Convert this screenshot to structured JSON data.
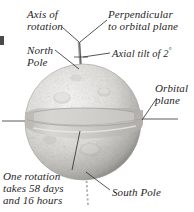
{
  "figure": {
    "background_color": "#ffffff",
    "ink_color": "#262626"
  },
  "labels": {
    "axis_of_rotation": "Axis of\nrotation",
    "perpendicular": "Perpendicular\nto orbital plane",
    "north_pole": "North\nPole",
    "axial_tilt_prefix": "Axial tilt of 2",
    "axial_tilt_degree": "°",
    "orbital_plane": "Orbital\nplane",
    "rotation_period": "One rotation\ntakes 58 days\nand 16 hours",
    "south_pole": "South Pole"
  },
  "values": {
    "axial_tilt_degrees": 2,
    "rotation_days": 58,
    "rotation_hours": 16
  },
  "colors": {
    "sphere_light": "#f2f1ef",
    "sphere_mid": "#d8d6d2",
    "sphere_shadow": "#b4b2ae",
    "ring_fill": "#c9c7c3",
    "ring_edge": "#9a9894",
    "leader_line": "#2b2b2b",
    "axis_line": "#555555"
  },
  "icons": {
    "sphere": "planet-sphere-icon",
    "ring": "orbital-plane-ring-icon",
    "axis": "rotation-axis-icon"
  }
}
